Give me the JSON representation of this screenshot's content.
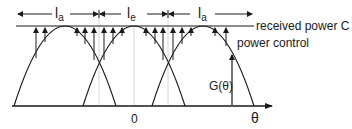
{
  "diagram": {
    "intervals": [
      {
        "symbol": "l",
        "subscript": "a"
      },
      {
        "symbol": "l",
        "subscript": "e"
      },
      {
        "symbol": "l",
        "subscript": "a"
      }
    ],
    "received_power_label": "received power C",
    "power_control_label": "power control",
    "gain_label": "G(θ)",
    "origin_label": "0",
    "axis_label": "θ",
    "colors": {
      "line": "#1a1a1a",
      "guide": "#d0d0d0"
    }
  }
}
